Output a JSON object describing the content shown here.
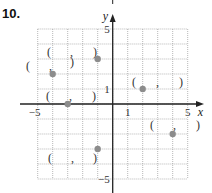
{
  "problem": {
    "number": "10."
  },
  "chart_data": {
    "type": "scatter",
    "title": "",
    "xlabel": "x",
    "ylabel": "y",
    "xlim": [
      -5,
      5
    ],
    "ylim": [
      -5,
      5
    ],
    "grid": true,
    "grid_style": "dotted",
    "x_tick_labels": [
      {
        "value": -5,
        "label": "−5"
      },
      {
        "value": 1,
        "label": "1"
      },
      {
        "value": 5,
        "label": "5"
      }
    ],
    "y_tick_labels": [
      {
        "value": 5,
        "label": "5"
      },
      {
        "value": 1,
        "label": "1"
      },
      {
        "value": -5,
        "label": "−5"
      }
    ],
    "points": [
      {
        "x": -4,
        "y": 2,
        "label": "(   ,   )"
      },
      {
        "x": -1,
        "y": 3,
        "label": "(   ,   )"
      },
      {
        "x": -3,
        "y": 0,
        "label": "(   ,   )"
      },
      {
        "x": 2,
        "y": 1,
        "label": "(   ,   )"
      },
      {
        "x": 4,
        "y": -2,
        "label": "(   ,   )"
      },
      {
        "x": -1,
        "y": -3,
        "label": "(   ,   )"
      }
    ],
    "point_color": "#8c8c8c",
    "axis_color": "#222222",
    "grid_color": "#9a9a9a"
  }
}
